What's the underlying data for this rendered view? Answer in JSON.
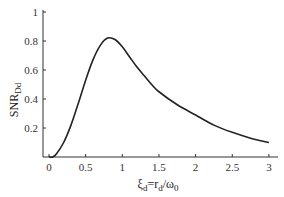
{
  "chart_data": {
    "type": "line",
    "title": "",
    "xlabel": "ξd = rd/ω0",
    "ylabel": "SNR_Dd",
    "xlabel_parts": {
      "main": "ξ",
      "sub": "d",
      "eq": "=r",
      "sub2": "d",
      "slash": "/ω",
      "sub3": "0"
    },
    "ylabel_parts": {
      "main": "SNR",
      "sub": "Dd"
    },
    "xlim": [
      0,
      3
    ],
    "ylim": [
      0,
      1
    ],
    "x_ticks": [
      "0",
      "0.5",
      "1",
      "1.5",
      "2",
      "2.5",
      "3"
    ],
    "y_ticks": [
      "0.2",
      "0.4",
      "0.6",
      "0.8",
      "1"
    ],
    "grid": false,
    "legend": null,
    "series": [
      {
        "name": "SNR_Dd",
        "color": "#222222",
        "x": [
          0.0,
          0.05,
          0.1,
          0.2,
          0.3,
          0.4,
          0.5,
          0.6,
          0.7,
          0.8,
          0.9,
          1.0,
          1.1,
          1.2,
          1.3,
          1.4,
          1.5,
          1.75,
          2.0,
          2.25,
          2.5,
          2.75,
          3.0
        ],
        "values": [
          0.0,
          0.0,
          0.02,
          0.1,
          0.22,
          0.37,
          0.53,
          0.67,
          0.77,
          0.82,
          0.81,
          0.76,
          0.69,
          0.62,
          0.56,
          0.5,
          0.45,
          0.36,
          0.29,
          0.22,
          0.17,
          0.13,
          0.1
        ]
      }
    ]
  }
}
